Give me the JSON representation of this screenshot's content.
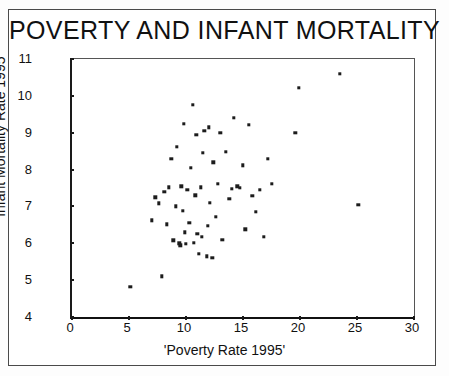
{
  "chart_data": {
    "type": "scatter",
    "title": "POVERTY AND INFANT MORTALITY",
    "xlabel": "'Poverty Rate 1995'",
    "ylabel": "'Infant Mortality Rate 1995",
    "xlim": [
      0,
      30
    ],
    "ylim": [
      4,
      11
    ],
    "xticks": [
      0,
      5,
      10,
      15,
      20,
      25,
      30
    ],
    "yticks": [
      4,
      5,
      6,
      7,
      8,
      9,
      10,
      11
    ],
    "grid": false,
    "legend": null,
    "marker": "square",
    "marker_color": "#1c1c1c",
    "series": [
      {
        "name": "States",
        "points": [
          [
            5.1,
            4.82
          ],
          [
            7.0,
            6.62
          ],
          [
            7.3,
            7.25
          ],
          [
            7.6,
            7.08
          ],
          [
            7.9,
            5.1
          ],
          [
            8.1,
            7.4
          ],
          [
            8.3,
            6.52
          ],
          [
            8.5,
            7.52
          ],
          [
            8.7,
            8.3
          ],
          [
            8.9,
            6.08
          ],
          [
            9.1,
            7.0
          ],
          [
            9.2,
            8.62
          ],
          [
            9.4,
            6.0
          ],
          [
            9.5,
            5.95
          ],
          [
            9.6,
            7.55
          ],
          [
            9.7,
            6.88
          ],
          [
            9.8,
            9.25
          ],
          [
            9.9,
            6.3
          ],
          [
            10.0,
            5.98
          ],
          [
            10.1,
            7.45
          ],
          [
            10.3,
            6.55
          ],
          [
            10.4,
            8.05
          ],
          [
            10.6,
            9.75
          ],
          [
            10.7,
            6.02
          ],
          [
            10.8,
            7.3
          ],
          [
            10.9,
            8.95
          ],
          [
            11.0,
            6.25
          ],
          [
            11.1,
            5.72
          ],
          [
            11.3,
            7.52
          ],
          [
            11.4,
            6.18
          ],
          [
            11.5,
            8.45
          ],
          [
            11.6,
            9.05
          ],
          [
            11.8,
            5.65
          ],
          [
            11.9,
            6.48
          ],
          [
            12.0,
            9.15
          ],
          [
            12.1,
            7.1
          ],
          [
            12.3,
            5.6
          ],
          [
            12.4,
            8.2
          ],
          [
            12.6,
            6.72
          ],
          [
            12.8,
            7.62
          ],
          [
            13.0,
            9.0
          ],
          [
            13.2,
            6.1
          ],
          [
            13.5,
            8.48
          ],
          [
            13.8,
            7.2
          ],
          [
            14.0,
            7.48
          ],
          [
            14.2,
            9.4
          ],
          [
            14.5,
            7.55
          ],
          [
            14.7,
            7.5
          ],
          [
            15.0,
            8.12
          ],
          [
            15.2,
            6.38
          ],
          [
            15.5,
            9.22
          ],
          [
            15.8,
            7.28
          ],
          [
            16.1,
            6.85
          ],
          [
            16.5,
            7.45
          ],
          [
            16.8,
            6.18
          ],
          [
            17.2,
            8.3
          ],
          [
            17.5,
            7.62
          ],
          [
            19.6,
            9.0
          ],
          [
            19.9,
            10.22
          ],
          [
            23.5,
            10.6
          ],
          [
            25.1,
            7.05
          ]
        ]
      }
    ]
  },
  "figure": {
    "tick_labels_y": [
      "11",
      "10",
      "9",
      "8",
      "7",
      "6",
      "5",
      "4"
    ],
    "tick_labels_x": [
      "0",
      "5",
      "10",
      "15",
      "20",
      "25",
      "30"
    ]
  }
}
